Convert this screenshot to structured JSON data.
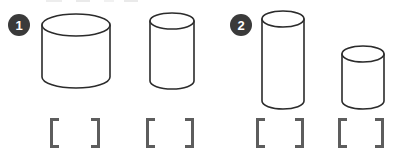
{
  "page": {
    "background_color": "#ffffff",
    "stroke_color": "#2b2b2b",
    "bracket_color": "#5d5d5d",
    "badge_color": "#3a3a3a",
    "badge_text_color": "#ffffff",
    "width": 396,
    "height": 153
  },
  "problems": [
    {
      "number": "1",
      "badge": {
        "x": 8,
        "y": 14,
        "label": "1"
      },
      "figures": [
        {
          "name": "cylinder-1a",
          "shape": "cylinder",
          "x": 40,
          "y": 14,
          "width": 72,
          "height": 74,
          "body_width": 68,
          "body_height": 58,
          "ellipse_ry": 11,
          "description": "wide short cylinder"
        },
        {
          "name": "cylinder-1b",
          "shape": "cylinder",
          "x": 148,
          "y": 12,
          "width": 48,
          "height": 78,
          "body_width": 42,
          "body_height": 62,
          "ellipse_ry": 8,
          "description": "narrow tall cylinder"
        }
      ],
      "answers": [
        {
          "name": "answer-bracket-1a",
          "x": 50,
          "y": 118,
          "width": 50,
          "value": ""
        },
        {
          "name": "answer-bracket-1b",
          "x": 146,
          "y": 118,
          "width": 48,
          "value": ""
        }
      ]
    },
    {
      "number": "2",
      "badge": {
        "x": 230,
        "y": 14,
        "label": "2"
      },
      "figures": [
        {
          "name": "cylinder-2a",
          "shape": "cylinder",
          "x": 260,
          "y": 10,
          "width": 46,
          "height": 100,
          "body_width": 40,
          "body_height": 84,
          "ellipse_ry": 8,
          "description": "narrow very tall cylinder"
        },
        {
          "name": "cylinder-2b",
          "shape": "cylinder",
          "x": 340,
          "y": 45,
          "width": 46,
          "height": 65,
          "body_width": 40,
          "body_height": 49,
          "ellipse_ry": 8,
          "description": "narrow short cylinder"
        }
      ],
      "answers": [
        {
          "name": "answer-bracket-2a",
          "x": 256,
          "y": 118,
          "width": 48,
          "value": ""
        },
        {
          "name": "answer-bracket-2b",
          "x": 338,
          "y": 118,
          "width": 46,
          "value": ""
        }
      ]
    }
  ]
}
